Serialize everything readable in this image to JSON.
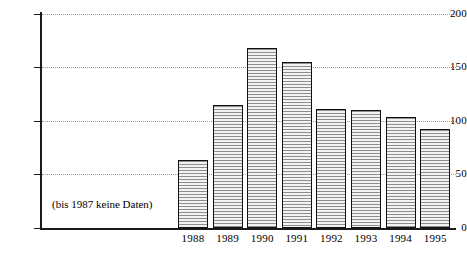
{
  "chart_data": {
    "type": "bar",
    "title": "",
    "subtitle": "",
    "xlabel": "",
    "ylabel": "",
    "categories": [
      "1988",
      "1989",
      "1990",
      "1991",
      "1992",
      "1993",
      "1994",
      "1995"
    ],
    "values": [
      64,
      115,
      168,
      155,
      111,
      110,
      104,
      93
    ],
    "series": [
      {
        "name": "",
        "values": [
          64,
          115,
          168,
          155,
          111,
          110,
          104,
          93
        ]
      }
    ],
    "ylim": [
      0,
      200
    ],
    "yticks": [
      0,
      50,
      100,
      150,
      200
    ],
    "ytick_labels": [
      "0",
      "50",
      "100",
      "150",
      "200"
    ],
    "xtick_labels": [
      "1988",
      "1989",
      "1990",
      "1991",
      "1992",
      "1993",
      "1994",
      "1995"
    ],
    "grid": true,
    "grid_style": "dotted-horizontal",
    "legend": false,
    "legend_position": "none",
    "annotations": [
      {
        "text": "(bis 1987 keine Daten)",
        "x": "left-plot-area",
        "y": 12
      }
    ],
    "bar_fill": "#b8b8b8",
    "bar_hatch": "horizontal-lines",
    "bar_edge_color": "#111111",
    "axis_color": "#1a1a1a",
    "grid_color": "#9a9a9a",
    "background": "#ffffff"
  },
  "axis": {
    "y_labels": [
      "200",
      "150",
      "100",
      "50",
      "0"
    ],
    "x_labels": [
      "1988",
      "1989",
      "1990",
      "1991",
      "1992",
      "1993",
      "1994",
      "1995"
    ]
  },
  "note": {
    "text": "(bis 1987 keine Daten)"
  }
}
